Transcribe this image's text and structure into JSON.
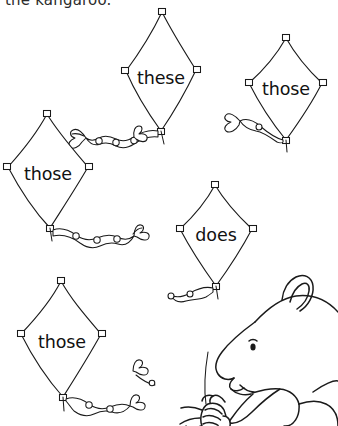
{
  "page": {
    "background_color": "#ffffff",
    "ink_color": "#1a1a1a",
    "top_text": {
      "content": "the kangaroo.",
      "note": "clipped at top edge of page, only lower portion of letters visible"
    }
  },
  "kites": [
    {
      "id": "kite-these",
      "word": "these",
      "position": "top-center",
      "bbox": [
        118,
        12,
        90,
        118
      ],
      "has_tail": true,
      "tail_bows": 2
    },
    {
      "id": "kite-those-top-right",
      "word": "those",
      "position": "top-right",
      "bbox": [
        245,
        36,
        83,
        106
      ],
      "has_tail": true,
      "tail_bows": 1
    },
    {
      "id": "kite-those-left",
      "word": "those",
      "position": "middle-left",
      "bbox": [
        5,
        112,
        87,
        116
      ],
      "has_tail": true,
      "tail_bows": 2
    },
    {
      "id": "kite-does",
      "word": "does",
      "position": "middle-right",
      "bbox": [
        176,
        183,
        86,
        104
      ],
      "has_tail": true,
      "tail_bows": 1
    },
    {
      "id": "kite-those-bottom-left",
      "word": "those",
      "position": "bottom-left",
      "bbox": [
        18,
        278,
        87,
        119
      ],
      "has_tail": true,
      "tail_bows": 2
    }
  ],
  "illustration": {
    "id": "kangaroo",
    "label": "kangaroo holding a kite string spool",
    "position": "bottom-right",
    "bbox": [
      175,
      288,
      163,
      138
    ],
    "style": "black and white line drawing"
  }
}
